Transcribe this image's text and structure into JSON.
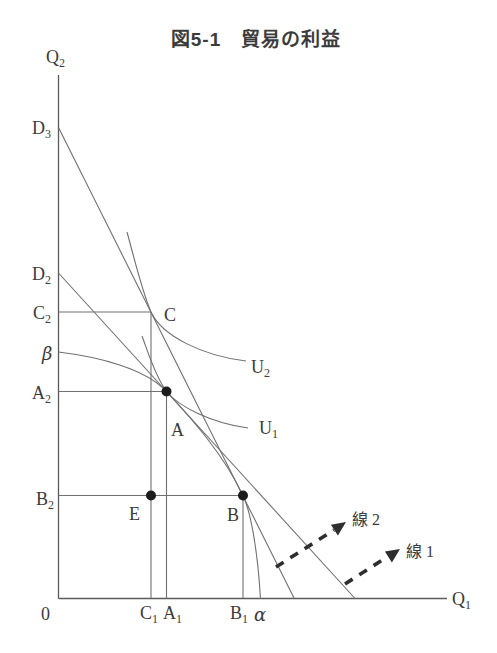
{
  "title": "図5-1　貿易の利益",
  "colors": {
    "background": "#ffffff",
    "line": "#707070",
    "axis": "#5a5a5a",
    "text": "#3b3b3b",
    "dot": "#1c1c1c",
    "arrow": "#2e2e2e"
  },
  "axes": {
    "y_label": {
      "main": "Q",
      "sub": "2"
    },
    "x_label": {
      "main": "Q",
      "sub": "1"
    },
    "origin": "0"
  },
  "y_axis_labels": {
    "d3": {
      "main": "D",
      "sub": "3"
    },
    "d2": {
      "main": "D",
      "sub": "2"
    },
    "c2": {
      "main": "C",
      "sub": "2"
    },
    "beta": "β",
    "a2": {
      "main": "A",
      "sub": "2"
    },
    "b2": {
      "main": "B",
      "sub": "2"
    }
  },
  "x_axis_labels": {
    "c1": {
      "main": "C",
      "sub": "1"
    },
    "a1": {
      "main": "A",
      "sub": "1"
    },
    "b1": {
      "main": "B",
      "sub": "1"
    },
    "alpha": "α"
  },
  "points": {
    "a": "A",
    "b": "B",
    "c": "C",
    "e": "E"
  },
  "curve_labels": {
    "u1": {
      "main": "U",
      "sub": "1"
    },
    "u2": {
      "main": "U",
      "sub": "2"
    }
  },
  "arrow_labels": {
    "line1": "線 1",
    "line2": "線 2"
  }
}
